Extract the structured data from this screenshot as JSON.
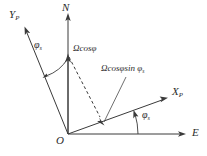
{
  "figure": {
    "type": "vector-diagram",
    "background_color": "#ffffff",
    "line_color": "#3a3a3a",
    "text_color": "#2b2b2b"
  },
  "axes": [
    {
      "id": "north",
      "label": "N",
      "subscript": "",
      "direction": "up",
      "origin": [
        68,
        134
      ],
      "tip": [
        68,
        14
      ]
    },
    {
      "id": "y-platform",
      "label": "Y",
      "subscript": "P",
      "direction": "up-left",
      "origin": [
        68,
        134
      ],
      "tip": [
        24,
        27
      ]
    },
    {
      "id": "x-platform",
      "label": "X",
      "subscript": "P",
      "direction": "up-right",
      "origin": [
        68,
        134
      ],
      "tip": [
        167,
        98
      ]
    },
    {
      "id": "east",
      "label": "E",
      "subscript": "",
      "direction": "right",
      "origin": [
        68,
        134
      ],
      "tip": [
        185,
        134
      ]
    }
  ],
  "origin_label": "O",
  "vectors": [
    {
      "id": "omega-cos-phi",
      "label": "Ωcosφ",
      "style": "solid",
      "from": [
        68,
        134
      ],
      "to": [
        68,
        55
      ],
      "note": "vertical component along N"
    },
    {
      "id": "omega-cos-phi-sin-phi-s",
      "label_main": "Ωcosφsin ",
      "label_symbol": "φ",
      "label_subscript": "s",
      "style": "solid-with-dashed-projection",
      "from": [
        68,
        134
      ],
      "to": [
        104,
        121
      ],
      "note": "projection onto X_P axis"
    }
  ],
  "projection": {
    "id": "dashed-projection",
    "style": "dashed",
    "from": [
      68,
      55
    ],
    "to": [
      104,
      121
    ]
  },
  "angles": [
    {
      "id": "phi-s-upper-left",
      "symbol": "φ",
      "subscript": "s",
      "between": [
        "N",
        "Y_P"
      ],
      "label_position": [
        37,
        42
      ]
    },
    {
      "id": "phi-s-lower-right",
      "symbol": "φ",
      "subscript": "s",
      "between": [
        "E",
        "X_P"
      ],
      "label_position": [
        142,
        112
      ]
    }
  ],
  "labels": {
    "y_p": {
      "base": "Y",
      "sub": "P"
    },
    "n": {
      "base": "N",
      "sub": ""
    },
    "x_p": {
      "base": "X",
      "sub": "P"
    },
    "e": {
      "base": "E",
      "sub": ""
    },
    "o": {
      "base": "O",
      "sub": ""
    },
    "omega_cos_phi": "Ωcosφ",
    "omega_cos_phi_sin": "Ωcosφsin ",
    "phi_symbol": "φ",
    "phi_subscript": "s"
  }
}
